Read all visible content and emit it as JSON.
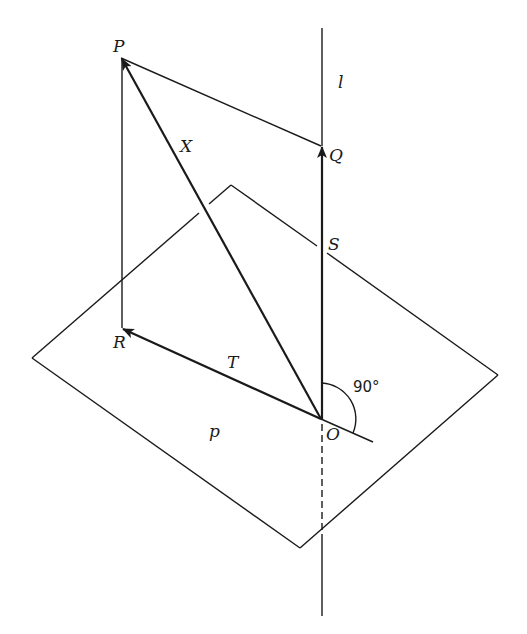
{
  "diagram": {
    "title": "",
    "colors": {
      "stroke": "#1a1a1a",
      "background": "#ffffff"
    },
    "labels": {
      "P": "P",
      "Q": "Q",
      "R": "R",
      "S": "S",
      "O": "O",
      "X": "X",
      "T": "T",
      "l": "l",
      "p": "p",
      "angle": "90°"
    },
    "points": {
      "P": [
        121,
        58
      ],
      "Q": [
        321,
        146
      ],
      "R": [
        122,
        328
      ],
      "O": [
        321,
        419
      ],
      "S": [
        322,
        252
      ]
    },
    "plane_p": {
      "name": "p",
      "corners": [
        [
          231,
          185
        ],
        [
          498,
          375
        ],
        [
          300,
          548
        ],
        [
          32,
          358
        ]
      ]
    },
    "line_l": {
      "name": "l",
      "from": [
        322,
        28
      ],
      "to": [
        322,
        616
      ],
      "dashed_segment": [
        [
          322,
          424
        ],
        [
          322,
          534
        ]
      ]
    },
    "vectors": [
      {
        "name": "X",
        "from": "O",
        "to": "P"
      },
      {
        "name": "T",
        "from": "O",
        "to": "R"
      },
      {
        "name": "S",
        "from": "O",
        "to": "Q"
      }
    ],
    "segments": [
      {
        "from": "P",
        "to": "Q"
      },
      {
        "from": "P",
        "to": "R"
      }
    ],
    "right_angle_marker": {
      "at": "O",
      "value": "90°"
    }
  }
}
